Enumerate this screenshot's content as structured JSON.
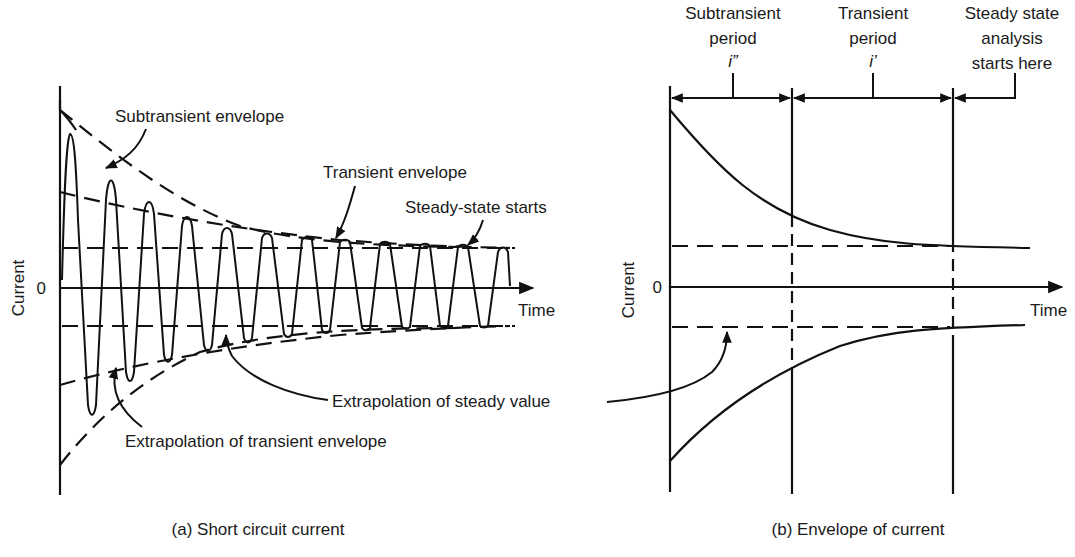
{
  "panel_a": {
    "caption": "(a) Short circuit current",
    "y_axis_label": "Current",
    "zero_label": "0",
    "x_axis_label": "Time",
    "annotations": {
      "subtransient_envelope": "Subtransient envelope",
      "transient_envelope": "Transient envelope",
      "steady_state_starts": "Steady-state starts",
      "extrapolation_transient": "Extrapolation of transient envelope",
      "extrapolation_steady": "Extrapolation of steady value"
    }
  },
  "panel_b": {
    "caption": "(b) Envelope of current",
    "y_axis_label": "Current",
    "zero_label": "0",
    "x_axis_label": "Time",
    "periods": [
      {
        "line1": "Subtransient",
        "line2": "period",
        "symbol": "i”"
      },
      {
        "line1": "Transient",
        "line2": "period",
        "symbol": "i’"
      },
      {
        "line1": "Steady state",
        "line2": "analysis",
        "line3": "starts here"
      }
    ]
  },
  "colors": {
    "ink": "#111111",
    "background": "#ffffff"
  }
}
